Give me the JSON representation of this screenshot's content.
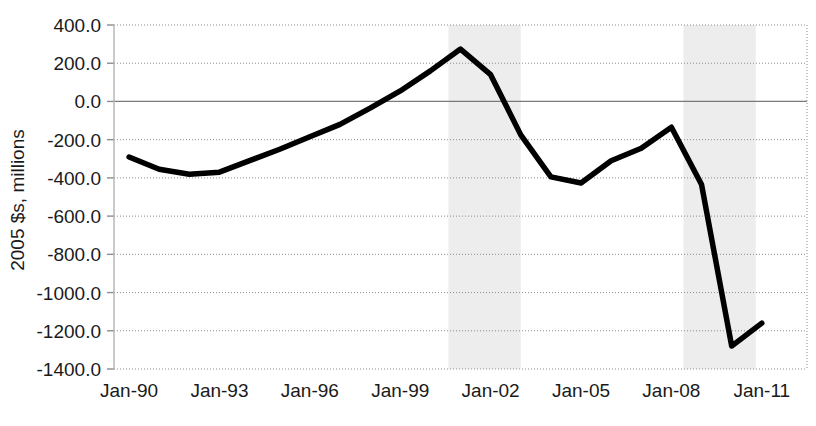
{
  "chart_data": {
    "type": "line",
    "title": "",
    "subtitle": "",
    "xlabel": "",
    "ylabel": "2005 $s, millions",
    "ylim": [
      -1400,
      400
    ],
    "ytick_step": 200,
    "ytick_labels": [
      "400.0",
      "200.0",
      "0.0",
      "-200.0",
      "-400.0",
      "-600.0",
      "-800.0",
      "-1000.0",
      "-1200.0",
      "-1400.0"
    ],
    "ytick_values": [
      400,
      200,
      0,
      -200,
      -400,
      -600,
      -800,
      -1000,
      -1200,
      -1400
    ],
    "xtick_labels": [
      "Jan-90",
      "Jan-93",
      "Jan-96",
      "Jan-99",
      "Jan-02",
      "Jan-05",
      "Jan-08",
      "Jan-11"
    ],
    "xtick_values": [
      1990,
      1993,
      1996,
      1999,
      2002,
      2005,
      2008,
      2011
    ],
    "xlim": [
      1989,
      1912.5
    ],
    "x_start": 1989.5,
    "x_end": 2012.5,
    "grid": "horizontal-dotted",
    "legend": "none",
    "line_color": "#000000",
    "band_color": "#ededed",
    "grid_color": "#8c8c8c",
    "zero_line_color": "#7a7a7a",
    "x": [
      1990,
      1991,
      1992,
      1993,
      1994,
      1995,
      1996,
      1997,
      1998,
      1999,
      2000,
      2001,
      2002,
      2003,
      2004,
      2005,
      2006,
      2007,
      2008,
      2009,
      2010,
      2011
    ],
    "values": [
      -291,
      -355,
      -381,
      -370,
      -310,
      -250,
      -185,
      -120,
      -35,
      55,
      160,
      274,
      140,
      -175,
      -395,
      -427,
      -310,
      -245,
      -135,
      -435,
      -1280,
      -1160
    ],
    "series": [
      {
        "name": "2005 $s, millions",
        "values": [
          -291,
          -355,
          -381,
          -370,
          -310,
          -250,
          -185,
          -120,
          -35,
          55,
          160,
          274,
          140,
          -175,
          -395,
          -427,
          -310,
          -245,
          -135,
          -435,
          -1280,
          -1160
        ]
      }
    ],
    "annotations": [],
    "recession_bands": [
      {
        "name": "recession-band-2001",
        "x_start": 2000.6,
        "x_end": 2003.0
      },
      {
        "name": "recession-band-2008",
        "x_start": 2008.4,
        "x_end": 2010.8
      }
    ]
  },
  "plot_geometry": {
    "left": 114,
    "right": 807,
    "top": 25,
    "bottom": 369
  }
}
